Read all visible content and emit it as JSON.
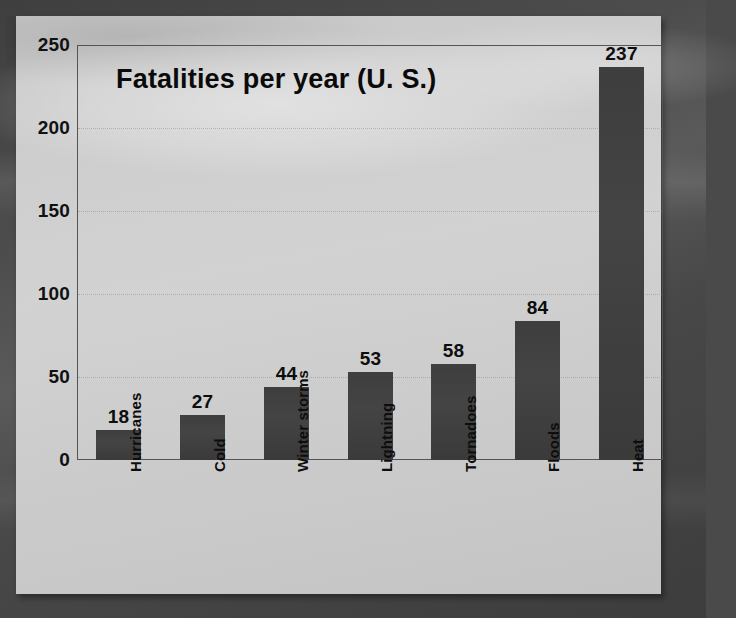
{
  "slide": {
    "background_color": "#4a4a4a",
    "panel_color": "#cdcdcd"
  },
  "chart_data": {
    "type": "bar",
    "title": "Fatalities per year (U. S.)",
    "xlabel": "",
    "ylabel": "",
    "categories": [
      "Hurricanes",
      "Cold",
      "Winter storms",
      "Lightning",
      "Tornadoes",
      "Floods",
      "Heat"
    ],
    "values": [
      18,
      27,
      44,
      53,
      58,
      84,
      237
    ],
    "value_labels": [
      "18",
      "27",
      "44",
      "53",
      "58",
      "84",
      "237"
    ],
    "ylim": [
      0,
      250
    ],
    "yticks": [
      0,
      50,
      100,
      150,
      200,
      250
    ],
    "ytick_labels": [
      "0",
      "50",
      "100",
      "150",
      "200",
      "250"
    ],
    "grid": true,
    "grid_style": "dotted-horizontal",
    "legend": false,
    "bar_color": "#404040",
    "axis_color": "#545454",
    "text_color": "#0d0d0d"
  }
}
